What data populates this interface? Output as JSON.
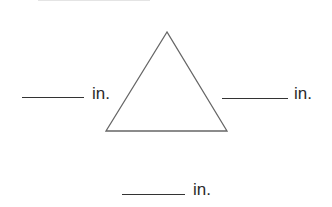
{
  "diagram": {
    "shape": "equilateral-triangle",
    "stroke_color": "#666666",
    "vertices": {
      "apex": [
        167,
        32
      ],
      "bottom_left": [
        106,
        131
      ],
      "bottom_right": [
        227,
        131
      ]
    }
  },
  "labels": {
    "left_side": {
      "blank": "",
      "unit": "in."
    },
    "right_side": {
      "blank": "",
      "unit": "in."
    },
    "bottom_side": {
      "blank": "",
      "unit": "in."
    }
  }
}
